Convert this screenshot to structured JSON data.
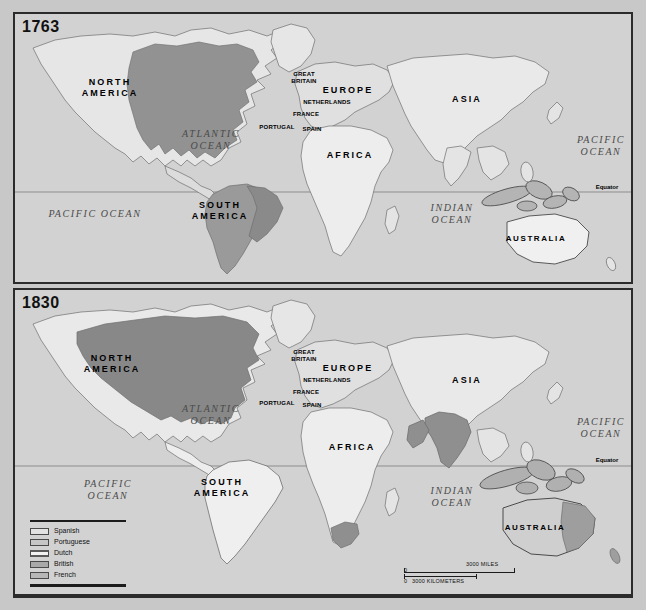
{
  "figure": {
    "background_color": "#c8c8c8",
    "panel_fill": "#d2d2d2",
    "border_color": "#2b2b2b"
  },
  "maps": [
    {
      "id": "map-1763",
      "year": "1763",
      "continent_labels": [
        {
          "name": "north-america",
          "text": "NORTH\nAMERICA",
          "x": 95,
          "y": 80
        },
        {
          "name": "south-america",
          "text": "SOUTH\nAMERICA",
          "x": 205,
          "y": 197
        },
        {
          "name": "europe",
          "text": "EUROPE",
          "x": 333,
          "y": 76
        },
        {
          "name": "africa",
          "text": "AFRICA",
          "x": 335,
          "y": 141
        },
        {
          "name": "asia",
          "text": "ASIA",
          "x": 452,
          "y": 85
        },
        {
          "name": "australia",
          "text": "AUSTRALIA",
          "x": 521,
          "y": 224
        }
      ],
      "ocean_labels": [
        {
          "name": "atlantic-ocean",
          "text": "ATLANTIC\nOCEAN",
          "x": 196,
          "y": 126
        },
        {
          "name": "pacific-ocean-west",
          "text": "PACIFIC OCEAN",
          "x": 80,
          "y": 200
        },
        {
          "name": "pacific-ocean-east",
          "text": "PACIFIC\nOCEAN",
          "x": 586,
          "y": 132
        },
        {
          "name": "indian-ocean",
          "text": "INDIAN\nOCEAN",
          "x": 437,
          "y": 200
        }
      ],
      "country_labels": [
        {
          "name": "great-britain",
          "text": "GREAT\nBRITAIN",
          "x": 289,
          "y": 70
        },
        {
          "name": "netherlands",
          "text": "NETHERLANDS",
          "x": 312,
          "y": 90
        },
        {
          "name": "france",
          "text": "FRANCE",
          "x": 291,
          "y": 100
        },
        {
          "name": "portugal",
          "text": "PORTUGAL",
          "x": 262,
          "y": 113
        },
        {
          "name": "spain",
          "text": "SPAIN",
          "x": 297,
          "y": 115
        }
      ],
      "equator_label": {
        "name": "equator",
        "text": "Equator",
        "x": 592,
        "y": 179
      }
    },
    {
      "id": "map-1830",
      "year": "1830",
      "continent_labels": [
        {
          "name": "north-america",
          "text": "NORTH\nAMERICA",
          "x": 97,
          "y": 80
        },
        {
          "name": "south-america",
          "text": "SOUTH\nAMERICA",
          "x": 207,
          "y": 198
        },
        {
          "name": "europe",
          "text": "EUROPE",
          "x": 333,
          "y": 78
        },
        {
          "name": "africa",
          "text": "AFRICA",
          "x": 337,
          "y": 157
        },
        {
          "name": "asia",
          "text": "ASIA",
          "x": 452,
          "y": 90
        },
        {
          "name": "australia",
          "text": "AUSTRALIA",
          "x": 520,
          "y": 237
        }
      ],
      "ocean_labels": [
        {
          "name": "atlantic-ocean",
          "text": "ATLANTIC\nOCEAN",
          "x": 196,
          "y": 125
        },
        {
          "name": "pacific-ocean-west",
          "text": "PACIFIC\nOCEAN",
          "x": 93,
          "y": 200
        },
        {
          "name": "pacific-ocean-east",
          "text": "PACIFIC\nOCEAN",
          "x": 586,
          "y": 138
        },
        {
          "name": "indian-ocean",
          "text": "INDIAN\nOCEAN",
          "x": 437,
          "y": 207
        }
      ],
      "country_labels": [
        {
          "name": "great-britain",
          "text": "GREAT\nBRITAIN",
          "x": 289,
          "y": 72
        },
        {
          "name": "netherlands",
          "text": "NETHERLANDS",
          "x": 312,
          "y": 92
        },
        {
          "name": "france",
          "text": "FRANCE",
          "x": 291,
          "y": 102
        },
        {
          "name": "portugal",
          "text": "PORTUGAL",
          "x": 262,
          "y": 113
        },
        {
          "name": "spain",
          "text": "SPAIN",
          "x": 297,
          "y": 115
        }
      ],
      "equator_label": {
        "name": "equator",
        "text": "Equator",
        "x": 592,
        "y": 176
      }
    }
  ],
  "legend": {
    "items": [
      {
        "label": "Spanish",
        "color": "#e2e2e2"
      },
      {
        "label": "Portuguese",
        "color": "#c6c6c6"
      },
      {
        "label": "Dutch",
        "color": "#f2f2f2"
      },
      {
        "label": "British",
        "color": "#a9a9a9"
      },
      {
        "label": "French",
        "color": "#b7b7b7"
      }
    ]
  },
  "scale_bar": {
    "miles": {
      "zero": "0",
      "value": "3000 MILES"
    },
    "kilometers": {
      "zero": "0",
      "value": "3000 KILOMETERS"
    }
  }
}
